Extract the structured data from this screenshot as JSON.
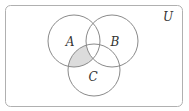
{
  "diagram": {
    "type": "venn",
    "universe_label": "U",
    "sets": [
      {
        "id": "A",
        "label": "A",
        "cx": 74,
        "cy": 41,
        "r": 26
      },
      {
        "id": "B",
        "label": "B",
        "cx": 112,
        "cy": 41,
        "r": 26
      },
      {
        "id": "C",
        "label": "C",
        "cx": 94,
        "cy": 70,
        "r": 26
      }
    ],
    "shaded_region": "A ∩ C ∩ B'",
    "colors": {
      "stroke": "#8a8a8a",
      "shade": "#dcdcdc",
      "background": "#ffffff",
      "text": "#333333"
    }
  }
}
